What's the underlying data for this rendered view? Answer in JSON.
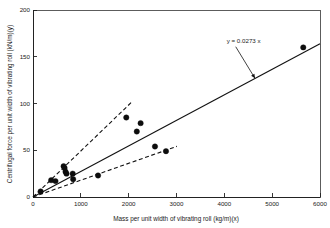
{
  "chart_data": {
    "type": "scatter",
    "title": "",
    "xlabel": "Mass per unit width of vibrating roll (kg/m)(x)",
    "ylabel": "Centrifugal force per unit width of vibrating roll (kN/m)(y)",
    "xlim": [
      0,
      6000
    ],
    "ylim": [
      0,
      200
    ],
    "xticks": [
      0,
      1000,
      2000,
      3000,
      4000,
      5000,
      6000
    ],
    "xtick_labels": [
      "0",
      "1000",
      "2000",
      "3000",
      "4000",
      "5000",
      "6000"
    ],
    "yticks": [
      0,
      50,
      100,
      150,
      200
    ],
    "ytick_labels": [
      "0",
      "50",
      "100",
      "150",
      "200"
    ],
    "grid": false,
    "legend": false,
    "marker": "filled-circle",
    "marker_color": "#0d0d0d",
    "points": [
      {
        "x": 160,
        "y": 6
      },
      {
        "x": 380,
        "y": 18
      },
      {
        "x": 470,
        "y": 17
      },
      {
        "x": 640,
        "y": 33
      },
      {
        "x": 660,
        "y": 31
      },
      {
        "x": 680,
        "y": 27
      },
      {
        "x": 700,
        "y": 25
      },
      {
        "x": 830,
        "y": 25
      },
      {
        "x": 840,
        "y": 19
      },
      {
        "x": 1360,
        "y": 23
      },
      {
        "x": 1950,
        "y": 85
      },
      {
        "x": 2170,
        "y": 70
      },
      {
        "x": 2250,
        "y": 79
      },
      {
        "x": 2550,
        "y": 54
      },
      {
        "x": 2780,
        "y": 49
      },
      {
        "x": 5650,
        "y": 160
      }
    ],
    "fit_line": {
      "label": "y = 0.0273 x",
      "slope": 0.0273,
      "intercept": 0,
      "style": "solid",
      "x_start": 0,
      "x_end": 6000
    },
    "bound_lines": [
      {
        "name": "upper-envelope",
        "slope": 0.0492,
        "intercept": 0,
        "style": "dashed",
        "x_start": 0,
        "x_end": 2060
      },
      {
        "name": "lower-envelope",
        "slope": 0.018,
        "intercept": 0,
        "style": "dashed",
        "x_start": 0,
        "x_end": 3010
      }
    ],
    "annotations": [
      {
        "name": "fit-equation",
        "text": "y = 0.0273 x",
        "text_x": 4050,
        "text_y": 165,
        "arrow_to_x": 4640,
        "arrow_to_y": 127
      }
    ]
  }
}
